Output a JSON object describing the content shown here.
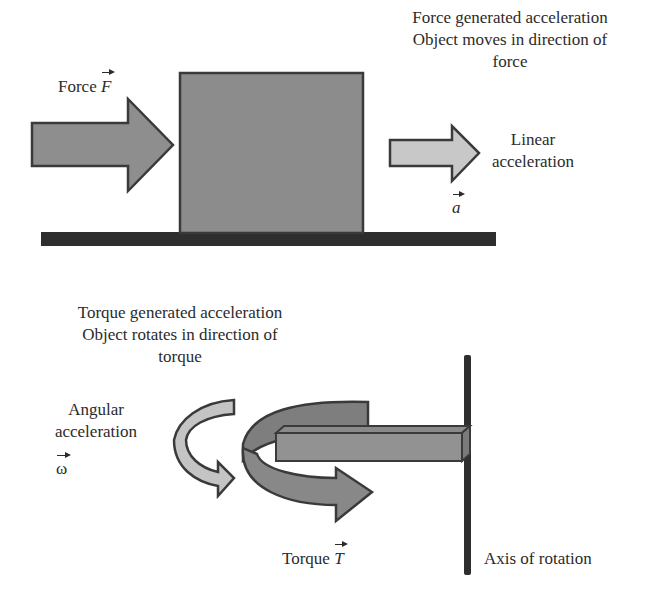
{
  "linear": {
    "force_label": "Force",
    "force_symbol": "F",
    "caption_line1": "Force generated acceleration",
    "caption_line2": "Object moves in direction of",
    "caption_line3": "force",
    "accel_line1": "Linear",
    "accel_line2": "acceleration",
    "accel_symbol": "a"
  },
  "rotational": {
    "caption_line1": "Torque generated acceleration",
    "caption_line2": "Object rotates in direction of",
    "caption_line3": "torque",
    "angular_line1": "Angular",
    "angular_line2": "acceleration",
    "angular_symbol": "ω",
    "torque_label": "Torque",
    "torque_symbol": "T",
    "axis_label": "Axis of rotation"
  },
  "colors": {
    "block_fill": "#8c8c8c",
    "force_arrow_fill": "#8e8e8e",
    "accel_arrow_fill": "#c8c8c8",
    "outline": "#3a3a3a",
    "ground": "#2e2e2e"
  }
}
